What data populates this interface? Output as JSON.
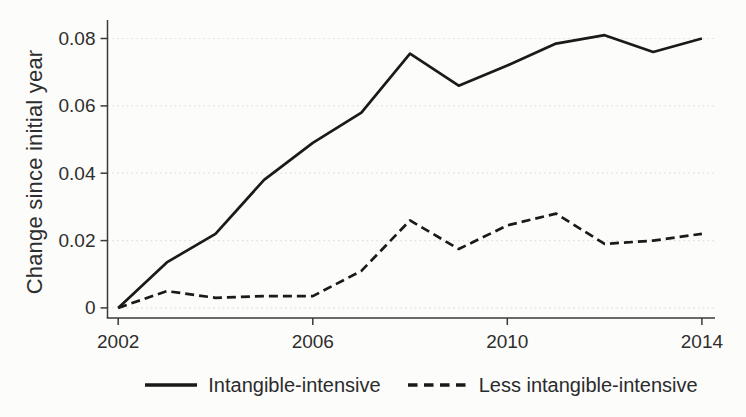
{
  "figure": {
    "background": "#fcfcfb",
    "line_color": "#1a1a1a",
    "axis_color": "#3a3a3a",
    "grid_color": "#e0e0de",
    "text_color": "#2e2e2e"
  },
  "chart_data": {
    "type": "line",
    "title": "",
    "xlabel": "",
    "ylabel": "Change since initial year",
    "x": [
      2002,
      2003,
      2004,
      2005,
      2006,
      2007,
      2008,
      2009,
      2010,
      2011,
      2012,
      2013,
      2014
    ],
    "series": [
      {
        "name": "Intangible-intensive",
        "line_style": "solid",
        "color": "#1a1a1a",
        "values": [
          0,
          0.0135,
          0.022,
          0.038,
          0.049,
          0.058,
          0.0755,
          0.066,
          0.072,
          0.0785,
          0.081,
          0.076,
          0.08
        ]
      },
      {
        "name": "Less intangible-intensive",
        "line_style": "dashed",
        "color": "#1a1a1a",
        "values": [
          0,
          0.005,
          0.003,
          0.0035,
          0.0035,
          0.011,
          0.026,
          0.0175,
          0.0245,
          0.028,
          0.019,
          0.02,
          0.022
        ]
      }
    ],
    "xtick_values": [
      2002,
      2006,
      2010,
      2014
    ],
    "xtick_labels": [
      "2002",
      "2006",
      "2010",
      "2014"
    ],
    "ytick_values": [
      0,
      0.02,
      0.04,
      0.06,
      0.08
    ],
    "ytick_labels": [
      "0",
      "0.02",
      "0.04",
      "0.06",
      "0.08"
    ],
    "xlim": [
      2001.78,
      2014.27
    ],
    "ylim": [
      -0.003,
      0.0855
    ],
    "grid": "horizontal-dotted",
    "legend_position": "bottom"
  }
}
